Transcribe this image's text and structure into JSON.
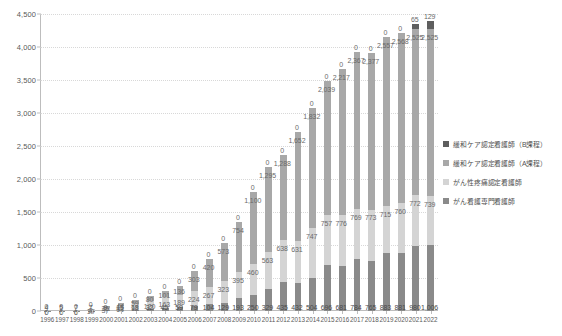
{
  "chart_data": {
    "type": "bar",
    "stacked": true,
    "title": "",
    "subtitle": "",
    "xlabel": "",
    "ylabel": "",
    "ylim": [
      0,
      4500
    ],
    "ytick_labels": [
      "0",
      "500",
      "1,000",
      "1,500",
      "2,000",
      "2,500",
      "3,000",
      "3,500",
      "4,000",
      "4,500"
    ],
    "ytick_values": [
      0,
      500,
      1000,
      1500,
      2000,
      2500,
      3000,
      3500,
      4000,
      4500
    ],
    "grid": true,
    "legend_position": "right",
    "categories": [
      "1996",
      "1997",
      "1998",
      "1999",
      "2000",
      "2001",
      "2002",
      "2003",
      "2004",
      "2005",
      "2006",
      "2007",
      "2008",
      "2009",
      "2010",
      "2011",
      "2012",
      "2013",
      "2014",
      "2015",
      "2016",
      "2017",
      "2018",
      "2019",
      "2020",
      "2021",
      "2022"
    ],
    "series": [
      {
        "name": "がん看護専門看護師",
        "color": "#8a8a8a",
        "values": [
          4,
          5,
          7,
          7,
          9,
          15,
          18,
          32,
          45,
          59,
          79,
          104,
          129,
          193,
          250,
          329,
          435,
          432,
          504,
          696,
          681,
          784,
          765,
          883,
          881,
          980,
          1006
        ]
      },
      {
        "name": "がん性疼痛認定看護師",
        "color": "#d4d4d4",
        "values": [
          0,
          0,
          0,
          19,
          37,
          61,
          92,
          120,
          163,
          189,
          224,
          267,
          323,
          395,
          460,
          563,
          638,
          631,
          747,
          757,
          776,
          769,
          773,
          715,
          760,
          772,
          739
        ]
      },
      {
        "name": "緩和ケア認定看護師(A課程)",
        "color": "#a8a8a8",
        "values": [
          0,
          0,
          0,
          8,
          26,
          44,
          59,
          80,
          101,
          136,
          303,
          420,
          573,
          754,
          1100,
          1295,
          1288,
          1652,
          1832,
          2039,
          2217,
          2367,
          2377,
          2557,
          2568,
          2525,
          2525
        ]
      },
      {
        "name": "緩和ケア認定看護師(B課程)",
        "color": "#5e5e5e",
        "values": [
          0,
          0,
          0,
          0,
          0,
          0,
          0,
          0,
          0,
          0,
          0,
          0,
          0,
          0,
          0,
          0,
          0,
          0,
          0,
          0,
          0,
          0,
          0,
          0,
          0,
          65,
          129
        ]
      }
    ]
  },
  "legend": {
    "items": [
      {
        "label": "緩和ケア認定看護師（B課程）",
        "color": "#5e5e5e"
      },
      {
        "label": "緩和ケア認定看護師（A課程）",
        "color": "#a8a8a8"
      },
      {
        "label": "がん性疼痛認定看護師",
        "color": "#d4d4d4"
      },
      {
        "label": "がん看護専門看護師",
        "color": "#8a8a8a"
      }
    ]
  }
}
